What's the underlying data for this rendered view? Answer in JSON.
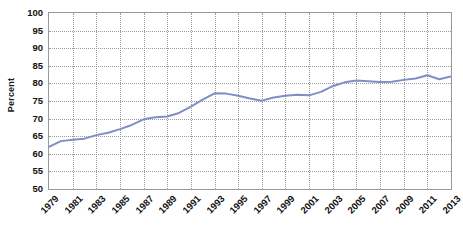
{
  "chart_data": {
    "type": "line",
    "title": "",
    "xlabel": "",
    "ylabel": "Percent",
    "ylim": [
      50,
      100
    ],
    "ytick_step": 5,
    "yticks": [
      100,
      95,
      90,
      85,
      80,
      75,
      70,
      65,
      60,
      55,
      50
    ],
    "grid": true,
    "legend": "none",
    "line_color": "#7f8fc6",
    "x": [
      1979,
      1980,
      1981,
      1982,
      1983,
      1984,
      1985,
      1986,
      1987,
      1988,
      1989,
      1990,
      1991,
      1992,
      1993,
      1994,
      1995,
      1996,
      1997,
      1998,
      1999,
      2000,
      2001,
      2002,
      2003,
      2004,
      2005,
      2006,
      2007,
      2008,
      2009,
      2010,
      2011,
      2012,
      2013
    ],
    "values": [
      62.0,
      63.6,
      64.0,
      64.3,
      65.3,
      66.0,
      67.0,
      68.2,
      69.8,
      70.4,
      70.6,
      71.6,
      73.4,
      75.4,
      77.2,
      77.1,
      76.5,
      75.7,
      75.1,
      76.0,
      76.5,
      76.8,
      76.6,
      77.6,
      79.2,
      80.3,
      80.8,
      80.6,
      80.4,
      80.5,
      81.0,
      81.4,
      82.3,
      81.2,
      82.0
    ],
    "xtick_labels": [
      "1979",
      "1981",
      "1983",
      "1985",
      "1987",
      "1989",
      "1991",
      "1993",
      "1995",
      "1997",
      "1999",
      "2001",
      "2003",
      "2005",
      "2007",
      "2009",
      "2011",
      "2013"
    ],
    "xtick_values": [
      1979,
      1981,
      1983,
      1985,
      1987,
      1989,
      1991,
      1993,
      1995,
      1997,
      1999,
      2001,
      2003,
      2005,
      2007,
      2009,
      2011,
      2013
    ],
    "xlim": [
      1979,
      2013
    ]
  }
}
